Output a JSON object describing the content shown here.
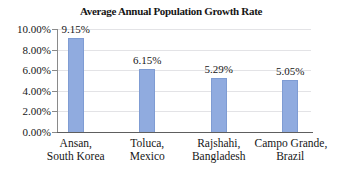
{
  "figure": {
    "background": "#FFFFFF"
  },
  "colors": {
    "background": "#FFFFFF",
    "bar_fill": "#90ABDF",
    "bar_border": "#7F9CD3",
    "gridline": "#E3E3E6",
    "axis": "#8A8A8A",
    "baseline": "#5E5E5E",
    "text": "#161616"
  },
  "chart_data": {
    "type": "bar",
    "title": "Average Annual Population Growth Rate",
    "categories": [
      [
        "Ansan,",
        "South Korea"
      ],
      [
        "Toluca,",
        "Mexico"
      ],
      [
        "Rajshahi,",
        "Bangladesh"
      ],
      [
        "Campo Grande,",
        "Brazil"
      ]
    ],
    "values": [
      9.15,
      6.15,
      5.29,
      5.05
    ],
    "data_labels": [
      "9.15%",
      "6.15%",
      "5.29%",
      "5.05%"
    ],
    "xlabel": "",
    "ylabel": "",
    "ylim": [
      0,
      10
    ],
    "ytick_step": 2,
    "ytick_labels": [
      "0.00%",
      "2.00%",
      "4.00%",
      "6.00%",
      "8.00%",
      "10.00%"
    ],
    "grid": true,
    "legend": false
  }
}
